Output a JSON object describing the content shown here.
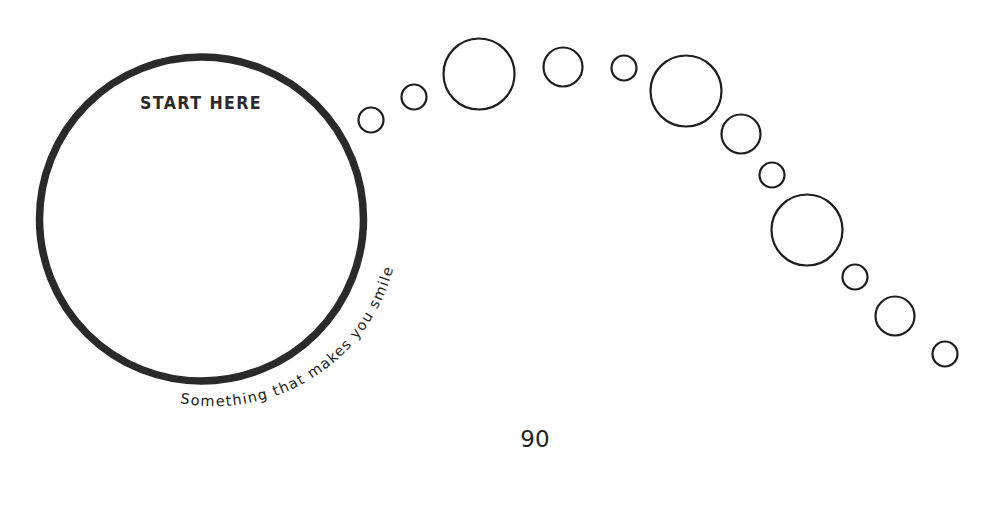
{
  "worksheet": {
    "main_circle": {
      "heading": "START HERE",
      "caption": "Something that makes you smile",
      "stroke_color": "#2a2a2a"
    },
    "bubble_trail": {
      "count": 12,
      "stroke_color": "#1e1e1e",
      "bubbles": [
        {
          "cx": 371,
          "cy": 120,
          "r": 12.5
        },
        {
          "cx": 414,
          "cy": 97,
          "r": 12.5
        },
        {
          "cx": 479,
          "cy": 74,
          "r": 35.5
        },
        {
          "cx": 563,
          "cy": 67,
          "r": 19.5
        },
        {
          "cx": 624,
          "cy": 68,
          "r": 12.5
        },
        {
          "cx": 686,
          "cy": 91,
          "r": 35.5
        },
        {
          "cx": 741,
          "cy": 134,
          "r": 19.5
        },
        {
          "cx": 772,
          "cy": 175,
          "r": 12.5
        },
        {
          "cx": 807,
          "cy": 230,
          "r": 35.5
        },
        {
          "cx": 855,
          "cy": 277,
          "r": 12.5
        },
        {
          "cx": 895,
          "cy": 316,
          "r": 19.5
        },
        {
          "cx": 945,
          "cy": 354,
          "r": 12.5
        }
      ]
    },
    "page_number": "90"
  }
}
